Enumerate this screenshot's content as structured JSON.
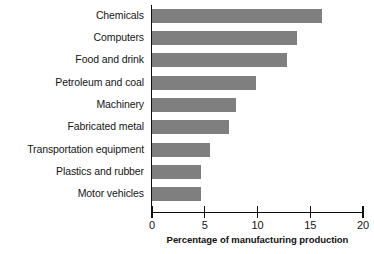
{
  "chart_data": {
    "type": "bar",
    "orientation": "horizontal",
    "title": "",
    "xlabel": "Percentage of manufacturing production",
    "ylabel": "",
    "categories": [
      "Chemicals",
      "Computers",
      "Food and drink",
      "Petroleum and coal",
      "Machinery",
      "Fabricated metal",
      "Transportation equipment",
      "Plastics and rubber",
      "Motor vehicles"
    ],
    "values": [
      16.1,
      13.7,
      12.8,
      9.9,
      8.0,
      7.3,
      5.5,
      4.6,
      4.6
    ],
    "xlim": [
      0,
      20
    ],
    "xticks": [
      0,
      5,
      10,
      15,
      20
    ],
    "xtick_labels": [
      "0",
      "5",
      "10",
      "15",
      "20"
    ],
    "grid": false,
    "legend": null,
    "bar_color": "#7f7f7f",
    "axis_color": "#0f0f0f",
    "background": "#ffffff"
  }
}
